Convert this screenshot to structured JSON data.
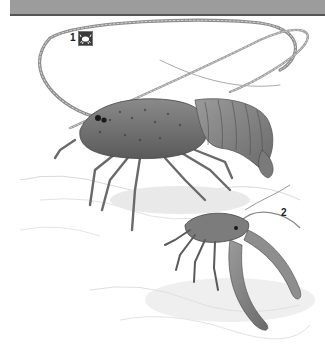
{
  "header": {
    "band_color": "#9c9c9c",
    "rule_color": "#555555"
  },
  "illustration": {
    "style": "grayscale pencil illustration",
    "subjects": [
      {
        "label": "1",
        "description": "spiny lobster with long antennae, side view",
        "has_icon": true,
        "icon": "crab-icon"
      },
      {
        "label": "2",
        "description": "smaller lobster, curled posture, front-quarter view",
        "has_icon": false
      }
    ]
  },
  "labels": {
    "one": "1",
    "two": "2"
  }
}
